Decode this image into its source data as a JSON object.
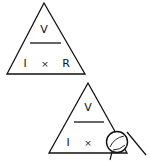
{
  "diagram": {
    "top": {
      "numerator": "V",
      "left": "I",
      "operator": "×",
      "right": "R"
    },
    "bottom": {
      "numerator": "V",
      "left": "I",
      "operator": "×",
      "covered": "R",
      "covered_by": "thumb-icon"
    },
    "colors": {
      "stroke": "#111111",
      "background": "#ffffff"
    }
  }
}
